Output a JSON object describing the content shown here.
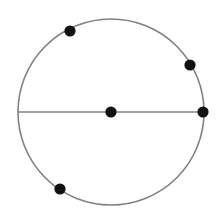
{
  "figure": {
    "canvas": {
      "width": 223,
      "height": 223,
      "background": "#ffffff"
    },
    "style": {
      "circle_stroke_color": "#808080",
      "circle_stroke_width": 1.6,
      "circle_fill": "none",
      "line_stroke_color": "#808080",
      "line_stroke_width": 1.6,
      "point_color": "#111111",
      "point_radius": 5.6
    },
    "circle": {
      "label": "circle",
      "center_x": 111,
      "center_y": 112,
      "radius": 93
    },
    "segment": {
      "label": "horizontal-diameter",
      "x1": 18,
      "y1": 112,
      "x2": 204,
      "y2": 112
    },
    "points": [
      {
        "label": "center-point",
        "x": 111,
        "y": 112,
        "on": "center"
      },
      {
        "label": "point-upper-left",
        "x": 70,
        "y": 31,
        "on": "circumference"
      },
      {
        "label": "point-upper-right",
        "x": 190,
        "y": 65,
        "on": "circumference"
      },
      {
        "label": "point-right-endpoint",
        "x": 203,
        "y": 112,
        "on": "circumference"
      },
      {
        "label": "point-lower-left",
        "x": 60,
        "y": 189,
        "on": "circumference"
      }
    ]
  },
  "chart_data": {
    "type": "scatter",
    "title": "",
    "xlabel": "",
    "ylabel": "",
    "xlim": [
      0,
      223
    ],
    "ylim": [
      0,
      223
    ],
    "grid": false,
    "legend": "none",
    "annotations": [
      {
        "kind": "circle",
        "cx": 111,
        "cy": 112,
        "r": 93
      },
      {
        "kind": "line",
        "x1": 18,
        "y1": 112,
        "x2": 204,
        "y2": 112
      }
    ],
    "series": [
      {
        "name": "marked points",
        "x": [
          111,
          70,
          190,
          203,
          60
        ],
        "y": [
          112,
          31,
          65,
          112,
          189
        ]
      }
    ]
  }
}
